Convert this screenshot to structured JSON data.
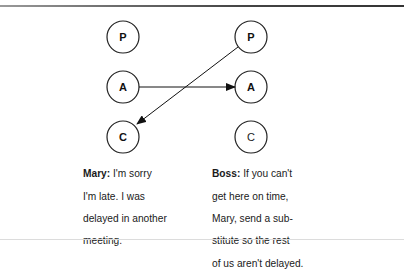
{
  "diagram": {
    "left_column": {
      "states": [
        {
          "label": "P",
          "bold": true
        },
        {
          "label": "A",
          "bold": true
        },
        {
          "label": "C",
          "bold": true
        }
      ]
    },
    "right_column": {
      "states": [
        {
          "label": "P",
          "bold": true
        },
        {
          "label": "A",
          "bold": true
        },
        {
          "label": "C",
          "bold": false
        }
      ]
    },
    "arrows": [
      {
        "from": "left.A",
        "to": "right.A"
      },
      {
        "from": "right.P",
        "to": "left.C"
      }
    ]
  },
  "captions": {
    "mary": {
      "speaker": "Mary:",
      "lines": [
        " I'm sorry",
        "I'm late. I was",
        "delayed in another",
        "meeting."
      ]
    },
    "boss": {
      "speaker": "Boss:",
      "lines": [
        " If you can't",
        "get here on time,",
        "Mary, send a sub-",
        "stitute so the rest",
        "of us aren't delayed."
      ]
    }
  }
}
